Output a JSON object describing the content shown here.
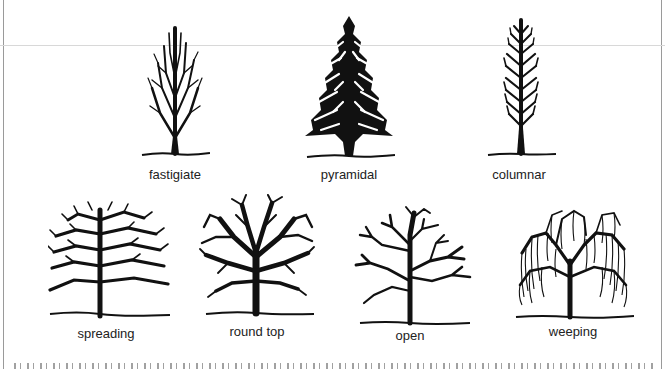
{
  "figure": {
    "row1": [
      {
        "id": "fastigiate",
        "label": "fastigiate",
        "icon": "fastigiate-tree-icon"
      },
      {
        "id": "pyramidal",
        "label": "pyramidal",
        "icon": "pyramidal-tree-icon"
      },
      {
        "id": "columnar",
        "label": "columnar",
        "icon": "columnar-tree-icon"
      }
    ],
    "row2": [
      {
        "id": "spreading",
        "label": "spreading",
        "icon": "spreading-tree-icon"
      },
      {
        "id": "round-top",
        "label": "round top",
        "icon": "round-top-tree-icon"
      },
      {
        "id": "open",
        "label": "open",
        "icon": "open-tree-icon"
      },
      {
        "id": "weeping",
        "label": "weeping",
        "icon": "weeping-tree-icon"
      }
    ]
  },
  "colors": {
    "ink": "#111111",
    "rule": "#d8d8d8",
    "border": "#9a9a9a"
  },
  "bottom_text": {
    "note": "clipped body text line, illegible"
  }
}
